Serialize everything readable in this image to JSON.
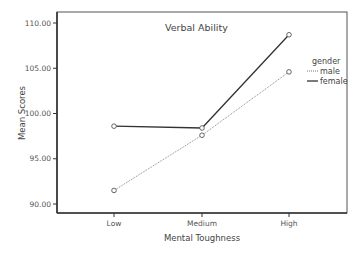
{
  "chart_data": {
    "type": "line",
    "title": "Verbal Ability",
    "xlabel": "Mental Toughness",
    "ylabel": "Mean Scores",
    "categories": [
      "Low",
      "Medium",
      "High"
    ],
    "series": [
      {
        "name": "male",
        "style": "dotted",
        "values": [
          91.5,
          97.6,
          104.6
        ]
      },
      {
        "name": "female",
        "style": "solid",
        "values": [
          98.6,
          98.4,
          108.7
        ]
      }
    ],
    "ylim": [
      89.0,
      111.3
    ],
    "yticks": [
      90,
      95,
      100,
      105,
      110
    ],
    "ytick_labels": [
      "90.00",
      "95.00",
      "100.00",
      "105.00",
      "110.00"
    ],
    "grid": false,
    "legend": {
      "title": "gender",
      "position": "right-inside",
      "entries": [
        "male",
        "female"
      ]
    }
  },
  "colors": {
    "male": "#888888",
    "female": "#333333",
    "frame": "#444444"
  }
}
